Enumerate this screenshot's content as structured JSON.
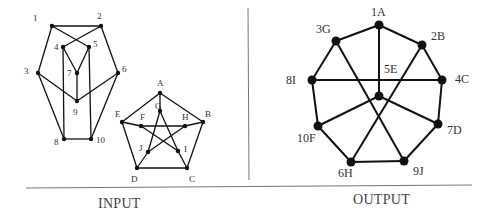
{
  "sections": {
    "input_label": "INPUT",
    "output_label": "OUTPUT"
  },
  "colors": {
    "edge": "#111111",
    "node": "#111111",
    "divider": "#777777",
    "text": "#333333"
  },
  "graphs": {
    "input_numbered": {
      "nodes": [
        {
          "id": "1",
          "label": "1",
          "x": 52,
          "y": 26,
          "lx": 33,
          "ly": 21
        },
        {
          "id": "2",
          "label": "2",
          "x": 101,
          "y": 26,
          "lx": 97,
          "ly": 19
        },
        {
          "id": "3",
          "label": "3",
          "x": 38,
          "y": 73,
          "lx": 24,
          "ly": 74
        },
        {
          "id": "4",
          "label": "4",
          "x": 63,
          "y": 47,
          "lx": 54,
          "ly": 50
        },
        {
          "id": "5",
          "label": "5",
          "x": 89,
          "y": 47,
          "lx": 93,
          "ly": 47
        },
        {
          "id": "6",
          "label": "6",
          "x": 118,
          "y": 73,
          "lx": 122,
          "ly": 72
        },
        {
          "id": "7",
          "label": "7",
          "x": 77,
          "y": 73,
          "lx": 67,
          "ly": 76
        },
        {
          "id": "8",
          "label": "8",
          "x": 64,
          "y": 139,
          "lx": 54,
          "ly": 145
        },
        {
          "id": "9",
          "label": "9",
          "x": 77,
          "y": 101,
          "lx": 73,
          "ly": 115
        },
        {
          "id": "10",
          "label": "10",
          "x": 91,
          "y": 139,
          "lx": 96,
          "ly": 143
        }
      ],
      "edges": [
        [
          "1",
          "2"
        ],
        [
          "1",
          "3"
        ],
        [
          "1",
          "5"
        ],
        [
          "2",
          "4"
        ],
        [
          "2",
          "6"
        ],
        [
          "4",
          "7"
        ],
        [
          "5",
          "7"
        ],
        [
          "7",
          "9"
        ],
        [
          "3",
          "9"
        ],
        [
          "6",
          "9"
        ],
        [
          "3",
          "8"
        ],
        [
          "6",
          "10"
        ],
        [
          "8",
          "10"
        ],
        [
          "4",
          "8"
        ],
        [
          "5",
          "10"
        ]
      ]
    },
    "input_lettered": {
      "nodes": [
        {
          "id": "A",
          "label": "A",
          "x": 160,
          "y": 93,
          "lx": 157,
          "ly": 86
        },
        {
          "id": "B",
          "label": "B",
          "x": 203,
          "y": 122,
          "lx": 205,
          "ly": 117
        },
        {
          "id": "C",
          "label": "C",
          "x": 187,
          "y": 168,
          "lx": 189,
          "ly": 182
        },
        {
          "id": "D",
          "label": "D",
          "x": 137,
          "y": 168,
          "lx": 131,
          "ly": 182
        },
        {
          "id": "E",
          "label": "E",
          "x": 122,
          "y": 122,
          "lx": 115,
          "ly": 117
        },
        {
          "id": "F",
          "label": "F",
          "x": 141,
          "y": 126,
          "lx": 140,
          "ly": 120
        },
        {
          "id": "G",
          "label": "G",
          "x": 160,
          "y": 111,
          "lx": 155,
          "ly": 109
        },
        {
          "id": "H",
          "label": "H",
          "x": 185,
          "y": 126,
          "lx": 182,
          "ly": 120
        },
        {
          "id": "I",
          "label": "I",
          "x": 178,
          "y": 151,
          "lx": 184,
          "ly": 152
        },
        {
          "id": "J",
          "label": "J",
          "x": 148,
          "y": 152,
          "lx": 139,
          "ly": 151
        }
      ],
      "edges": [
        [
          "A",
          "B"
        ],
        [
          "B",
          "C"
        ],
        [
          "C",
          "D"
        ],
        [
          "D",
          "E"
        ],
        [
          "E",
          "A"
        ],
        [
          "A",
          "G"
        ],
        [
          "B",
          "H"
        ],
        [
          "C",
          "I"
        ],
        [
          "D",
          "J"
        ],
        [
          "E",
          "F"
        ],
        [
          "F",
          "H"
        ],
        [
          "F",
          "I"
        ],
        [
          "H",
          "J"
        ],
        [
          "G",
          "J"
        ],
        [
          "G",
          "I"
        ]
      ]
    },
    "output": {
      "nodes": [
        {
          "id": "1A",
          "label": "1A",
          "x": 379,
          "y": 25,
          "lx": 371,
          "ly": 16
        },
        {
          "id": "2B",
          "label": "2B",
          "x": 422,
          "y": 45,
          "lx": 431,
          "ly": 40
        },
        {
          "id": "3G",
          "label": "3G",
          "x": 336,
          "y": 41,
          "lx": 316,
          "ly": 33
        },
        {
          "id": "4C",
          "label": "4C",
          "x": 442,
          "y": 80,
          "lx": 455,
          "ly": 83
        },
        {
          "id": "5E",
          "label": "5E",
          "x": 379,
          "y": 96,
          "lx": 384,
          "ly": 73
        },
        {
          "id": "6H",
          "label": "6H",
          "x": 351,
          "y": 162,
          "lx": 338,
          "ly": 177
        },
        {
          "id": "7D",
          "label": "7D",
          "x": 438,
          "y": 124,
          "lx": 447,
          "ly": 134
        },
        {
          "id": "8I",
          "label": "8I",
          "x": 312,
          "y": 80,
          "lx": 286,
          "ly": 84
        },
        {
          "id": "9J",
          "label": "9J",
          "x": 404,
          "y": 161,
          "lx": 413,
          "ly": 175
        },
        {
          "id": "10F",
          "label": "10F",
          "x": 318,
          "y": 126,
          "lx": 297,
          "ly": 142
        }
      ],
      "edges": [
        [
          "1A",
          "3G"
        ],
        [
          "1A",
          "2B"
        ],
        [
          "1A",
          "5E"
        ],
        [
          "3G",
          "8I"
        ],
        [
          "3G",
          "9J"
        ],
        [
          "2B",
          "4C"
        ],
        [
          "2B",
          "6H"
        ],
        [
          "8I",
          "4C"
        ],
        [
          "8I",
          "10F"
        ],
        [
          "4C",
          "7D"
        ],
        [
          "5E",
          "10F"
        ],
        [
          "5E",
          "7D"
        ],
        [
          "10F",
          "6H"
        ],
        [
          "7D",
          "9J"
        ],
        [
          "6H",
          "9J"
        ]
      ]
    }
  }
}
